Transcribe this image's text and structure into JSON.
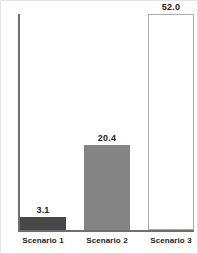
{
  "chart_data": {
    "type": "bar",
    "title": "",
    "subtitle": "",
    "xlabel": "",
    "ylabel": "",
    "categories": [
      "Scenario 1",
      "Scenario 2",
      "Scenario 3"
    ],
    "values": [
      3.1,
      20.4,
      52.0
    ],
    "value_labels": [
      "3.1",
      "20.4",
      "52.0"
    ],
    "ylim": [
      0,
      52.0
    ],
    "grid": false,
    "legend": null,
    "y_tick_labels": [],
    "bar_styles": [
      {
        "fill": "#474747",
        "border": "#474747"
      },
      {
        "fill": "#848484",
        "border": "#848484"
      },
      {
        "fill": "#ffffff",
        "border": "#a9a9a9"
      }
    ],
    "axis_color": "#6e6e6e"
  }
}
